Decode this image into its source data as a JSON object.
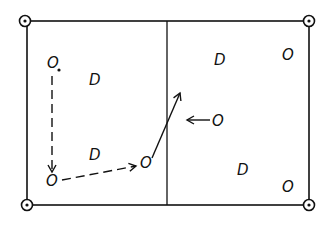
{
  "diagram": {
    "colors": {
      "ink": "#111111",
      "background": "#ffffff"
    },
    "frame": {
      "x": 27,
      "y": 21,
      "width": 282,
      "height": 184,
      "divider_x": 167
    },
    "corner_markers": [
      {
        "id": "top-left",
        "x": 25,
        "y": 21
      },
      {
        "id": "top-right",
        "x": 309,
        "y": 21
      },
      {
        "id": "bottom-left",
        "x": 27,
        "y": 205
      },
      {
        "id": "bottom-right",
        "x": 309,
        "y": 205
      }
    ],
    "labels": [
      {
        "id": "o1",
        "text": "O",
        "x": 47,
        "y": 68
      },
      {
        "id": "d1",
        "text": "D",
        "x": 89,
        "y": 85
      },
      {
        "id": "d2",
        "text": "D",
        "x": 89,
        "y": 160
      },
      {
        "id": "o2",
        "text": "O",
        "x": 46,
        "y": 186
      },
      {
        "id": "o3",
        "text": "O",
        "x": 140,
        "y": 168
      },
      {
        "id": "d3",
        "text": "D",
        "x": 214,
        "y": 65
      },
      {
        "id": "o4",
        "text": "O",
        "x": 282,
        "y": 60
      },
      {
        "id": "o5",
        "text": "O",
        "x": 212,
        "y": 126
      },
      {
        "id": "d4",
        "text": "D",
        "x": 237,
        "y": 175
      },
      {
        "id": "o6",
        "text": "O",
        "x": 282,
        "y": 192
      }
    ],
    "arrows": [
      {
        "id": "o1-to-o2",
        "style": "dashed",
        "from": [
          52,
          76
        ],
        "to": [
          52,
          172
        ]
      },
      {
        "id": "o2-to-o3",
        "style": "dashed",
        "from": [
          62,
          180
        ],
        "to": [
          136,
          166
        ]
      },
      {
        "id": "o3-across-divider",
        "style": "solid",
        "from": [
          152,
          158
        ],
        "to": [
          180,
          93
        ]
      },
      {
        "id": "o5-to-left",
        "style": "solid",
        "from": [
          210,
          120
        ],
        "to": [
          187,
          120
        ]
      }
    ]
  }
}
